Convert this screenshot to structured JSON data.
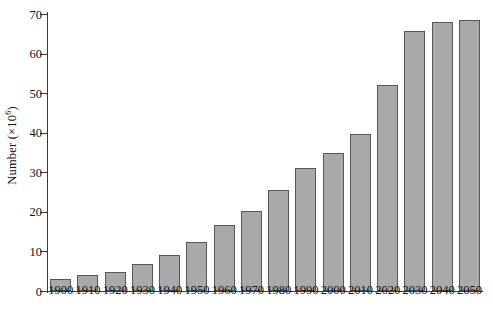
{
  "chart_data": {
    "type": "bar",
    "title": "",
    "subtitle": "",
    "xlabel": "",
    "ylabel": "Number (×10⁶)",
    "ylabel_base": "Number (×10",
    "ylabel_exponent": "6",
    "ylabel_close": ")",
    "categories": [
      "1900",
      "1910",
      "1920",
      "1930",
      "1940",
      "1950",
      "1960",
      "1970",
      "1980",
      "1990",
      "2000",
      "2010",
      "2020",
      "2030",
      "2040",
      "2050"
    ],
    "values": [
      3.1,
      4.0,
      4.9,
      6.8,
      9.1,
      12.3,
      16.6,
      20.1,
      25.5,
      31.2,
      35.0,
      39.6,
      52.0,
      65.6,
      68.1,
      68.5
    ],
    "ylim": [
      0,
      70
    ],
    "yticks": [
      0,
      10,
      20,
      30,
      40,
      50,
      60,
      70
    ],
    "ytick_labels": [
      "0",
      "10",
      "20",
      "30",
      "40",
      "50",
      "60",
      "70"
    ],
    "grid": false,
    "legend": null,
    "legend_position": "none",
    "bar_fill_color": "#a9a9a9",
    "bar_edge_color": "#575757",
    "axis_color": "#3a3a3a",
    "background_color": "#ffffff"
  }
}
